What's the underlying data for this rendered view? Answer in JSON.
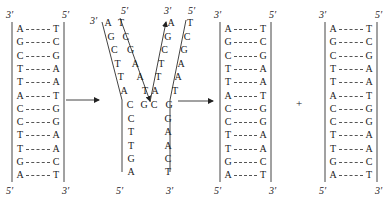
{
  "labels": {
    "three_prime": "3′",
    "five_prime": "5′"
  },
  "parent_duplex": {
    "left_strand": [
      "A",
      "G",
      "C",
      "T",
      "T",
      "A",
      "C",
      "C",
      "T",
      "T",
      "G",
      "A"
    ],
    "right_strand": [
      "T",
      "C",
      "G",
      "A",
      "A",
      "T",
      "G",
      "G",
      "A",
      "A",
      "C",
      "T"
    ],
    "left_top": "3′",
    "left_bottom": "5′",
    "right_top": "5′",
    "right_bottom": "3′"
  },
  "fork": {
    "left_arm_outer": [
      "A",
      "G",
      "C",
      "T",
      "T",
      "A"
    ],
    "left_arm_inner": [
      "T",
      "C",
      "G",
      "A",
      "A",
      "T"
    ],
    "right_arm_inner": [
      "A",
      "G",
      "C",
      "T",
      "T",
      "A"
    ],
    "right_arm_outer": [
      "T",
      "C",
      "G",
      "A",
      "A",
      "T"
    ],
    "junction_row": [
      "C",
      "G",
      "C",
      "G"
    ],
    "stem_left": [
      "C",
      "T",
      "T",
      "G",
      "A"
    ],
    "stem_right": [
      "G",
      "A",
      "A",
      "C",
      "T"
    ],
    "top_labels": [
      "3′",
      "5′",
      "3′",
      "5′"
    ],
    "bottom_labels": [
      "5′",
      "3′"
    ]
  },
  "daughter_1": {
    "left_strand": [
      "A",
      "G",
      "C",
      "T",
      "T",
      "A",
      "C",
      "C",
      "T",
      "T",
      "G",
      "A"
    ],
    "right_strand": [
      "T",
      "C",
      "G",
      "A",
      "A",
      "T",
      "G",
      "G",
      "A",
      "A",
      "C",
      "T"
    ],
    "left_top": "3′",
    "left_bottom": "5′",
    "right_top": "5′",
    "right_bottom": "3′"
  },
  "plus_sign": "+",
  "daughter_2": {
    "left_strand": [
      "A",
      "G",
      "C",
      "T",
      "T",
      "A",
      "C",
      "C",
      "T",
      "T",
      "G",
      "A"
    ],
    "right_strand": [
      "T",
      "C",
      "G",
      "A",
      "A",
      "T",
      "G",
      "G",
      "A",
      "A",
      "C",
      "T"
    ],
    "left_top": "3′",
    "left_bottom": "5′",
    "right_top": "5′",
    "right_bottom": "3′"
  }
}
